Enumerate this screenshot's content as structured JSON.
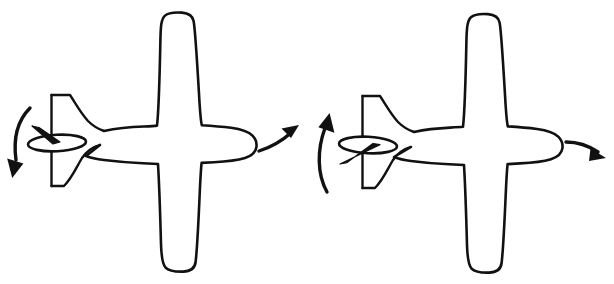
{
  "figure": {
    "background_color": "#ffffff",
    "line_color": "#111111",
    "width": 614,
    "height": 284,
    "panel_count": 2
  },
  "panels": [
    {
      "id": "left-panel",
      "name": "left-aircraft-diagram",
      "aircraft": {
        "view": "top-plan-view",
        "nose_direction": "left",
        "parts": [
          "fuselage",
          "upper-wing",
          "lower-wing",
          "vertical-fin",
          "upper-horizontal-stabilizer",
          "lower-horizontal-stabilizer",
          "propeller-hub",
          "propeller-blade"
        ]
      },
      "propeller_arrow": {
        "name": "propeller-rotation-arrow",
        "direction": "down",
        "sense": "counterclockwise",
        "arrowhead_position": "bottom"
      },
      "yaw_arrow": {
        "name": "tail-yaw-arrow",
        "direction": "up-right",
        "sense": "yaw-left",
        "arrowhead_position": "upper-right"
      },
      "propeller_blade": {
        "name": "propeller-blade",
        "tip_direction": "up-left"
      }
    },
    {
      "id": "right-panel",
      "name": "right-aircraft-diagram",
      "aircraft": {
        "view": "top-plan-view",
        "nose_direction": "left",
        "parts": [
          "fuselage",
          "upper-wing",
          "lower-wing",
          "vertical-fin",
          "upper-horizontal-stabilizer",
          "lower-horizontal-stabilizer",
          "propeller-hub",
          "propeller-blade"
        ]
      },
      "propeller_arrow": {
        "name": "propeller-rotation-arrow",
        "direction": "up",
        "sense": "clockwise",
        "arrowhead_position": "top"
      },
      "yaw_arrow": {
        "name": "tail-yaw-arrow",
        "direction": "down-right",
        "sense": "yaw-right",
        "arrowhead_position": "lower-right"
      },
      "propeller_blade": {
        "name": "propeller-blade",
        "tip_direction": "down-left"
      }
    }
  ],
  "labels": {
    "caption": ""
  }
}
